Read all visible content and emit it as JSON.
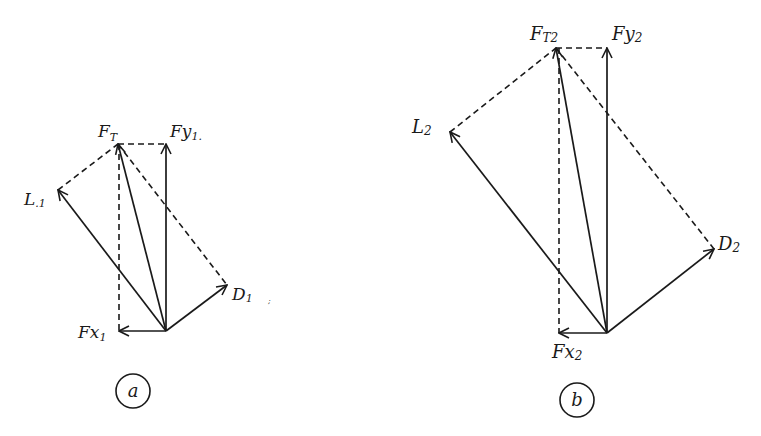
{
  "diagrams": [
    {
      "id": "a",
      "caption": "a",
      "labels": {
        "ft": {
          "main": "F",
          "sub": "T"
        },
        "fy": {
          "main": "Fy",
          "sub": "1."
        },
        "l": {
          "main": "L",
          "sub": ".1"
        },
        "d": {
          "main": "D",
          "sub": "1"
        },
        "fx": {
          "main": "Fx",
          "sub": "1"
        }
      }
    },
    {
      "id": "b",
      "caption": "b",
      "labels": {
        "ft": {
          "main": "F",
          "sub": "T2"
        },
        "fy": {
          "main": "Fy",
          "sub": "2"
        },
        "l": {
          "main": "L",
          "sub": "2"
        },
        "d": {
          "main": "D",
          "sub": "2"
        },
        "fx": {
          "main": "Fx",
          "sub": "2"
        }
      }
    }
  ],
  "colors": {
    "ink": "#1a1a1a",
    "background": "#ffffff"
  }
}
